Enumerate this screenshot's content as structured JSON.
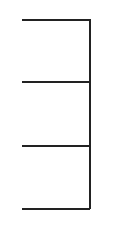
{
  "diagram": {
    "type": "bracket-tree",
    "stroke_color": "#222222",
    "stroke_width": 2,
    "trunk": {
      "x": 89,
      "y1": 19,
      "y2": 209
    },
    "branches": [
      {
        "y": 19,
        "x1": 22,
        "x2": 90
      },
      {
        "y": 81,
        "x1": 22,
        "x2": 90
      },
      {
        "y": 145,
        "x1": 22,
        "x2": 90
      },
      {
        "y": 208,
        "x1": 22,
        "x2": 90
      }
    ]
  }
}
